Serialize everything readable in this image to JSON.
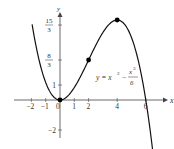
{
  "chart_data": {
    "type": "line",
    "title": "",
    "xlabel": "x",
    "ylabel": "y",
    "equation": {
      "lhs": "y = x",
      "exp1": "2",
      "minus": "−",
      "num": "x",
      "exp2": "3",
      "den": "6"
    },
    "x_ticks": [
      {
        "value": -2,
        "label": "−2"
      },
      {
        "value": -1,
        "label": "−1"
      },
      {
        "value": 0,
        "label": "0"
      },
      {
        "value": 1,
        "label": "1"
      },
      {
        "value": 2,
        "label": "2"
      },
      {
        "value": 4,
        "label": "4"
      },
      {
        "value": 6,
        "label": "6"
      }
    ],
    "y_ticks": [
      {
        "value": 5,
        "label_num": "15",
        "label_den": "3"
      },
      {
        "value": 2.667,
        "label_num": "8",
        "label_den": "3"
      },
      {
        "value": 1,
        "label": "1"
      },
      {
        "value": -2,
        "label": "−2"
      }
    ],
    "series": [
      {
        "name": "y = x^2 - x^3/6",
        "function": "x^2 - x^3/6",
        "x_range": [
          -1.95,
          6.7
        ]
      }
    ],
    "points": [
      {
        "x": 0,
        "y": 0
      },
      {
        "x": 2,
        "y": 2.667
      },
      {
        "x": 4,
        "y": 5.333
      }
    ],
    "xlim": [
      -2.5,
      7.2
    ],
    "ylim": [
      -2.3,
      6
    ],
    "grid": false,
    "legend": "none"
  },
  "colors": {
    "curve": "#111111",
    "axis": "#444444",
    "point": "#000000",
    "text": "#333333"
  }
}
